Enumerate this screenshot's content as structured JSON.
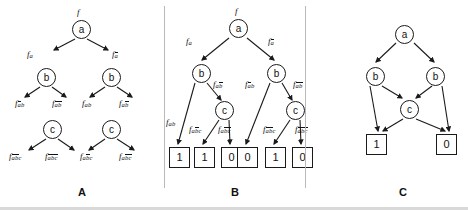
{
  "figure": {
    "caption_a": "A",
    "caption_b": "B",
    "caption_c": "C",
    "root_label": "f",
    "accent": "#1a1a1a",
    "divider_color": "#b9b9b9"
  },
  "panel_a": {
    "name": "shannon-expansion-levels",
    "level1": {
      "node": "a",
      "top_label": "f",
      "left_label": {
        "f": "f",
        "sub": "a",
        "bars": "none"
      },
      "right_label": {
        "f": "f",
        "sub": "a",
        "bars": "a"
      }
    },
    "level2": [
      {
        "node": "b",
        "left_label": {
          "f": "f",
          "sub": "ab",
          "bars": "a"
        },
        "right_label": {
          "f": "f",
          "sub": "ab",
          "bars": "ab"
        }
      },
      {
        "node": "b",
        "left_label": {
          "f": "f",
          "sub": "ab",
          "bars": "none"
        },
        "right_label": {
          "f": "f",
          "sub": "ab",
          "bars": "b"
        }
      }
    ],
    "level3": [
      {
        "node": "c",
        "left_label": {
          "f": "f",
          "sub": "abc",
          "bars": "ab"
        },
        "right_label": {
          "f": "f",
          "sub": "abc",
          "bars": "abc"
        }
      },
      {
        "node": "c",
        "left_label": {
          "f": "f",
          "sub": "abc",
          "bars": "b"
        },
        "right_label": {
          "f": "f",
          "sub": "abc",
          "bars": "bc"
        }
      }
    ]
  },
  "panel_b": {
    "name": "binary-decision-tree",
    "root": {
      "node": "a",
      "top_label": "f"
    },
    "edge_labels_level1": [
      {
        "f": "f",
        "sub": "a",
        "bars": "none"
      },
      {
        "f": "f",
        "sub": "a",
        "bars": "a"
      }
    ],
    "level2_nodes": [
      "b",
      "b"
    ],
    "edge_labels_level2": [
      {
        "f": "f",
        "sub": "ab",
        "bars": "none"
      },
      {
        "f": "f",
        "sub": "ab",
        "bars": "b"
      },
      {
        "f": "f",
        "sub": "ab",
        "bars": "a"
      },
      {
        "f": "f",
        "sub": "ab",
        "bars": "ab"
      }
    ],
    "level3_nodes": [
      "c",
      "c"
    ],
    "edge_labels_level3": [
      {
        "f": "f",
        "sub": "abc",
        "bars": "b"
      },
      {
        "f": "f",
        "sub": "abc",
        "bars": "bc"
      },
      {
        "f": "f",
        "sub": "abc",
        "bars": "ab"
      },
      {
        "f": "f",
        "sub": "abc",
        "bars": "abc"
      }
    ],
    "leaves": [
      "1",
      "1",
      "0",
      "0",
      "1",
      "0"
    ]
  },
  "panel_c": {
    "name": "reduced-ordered-bdd",
    "root": "a",
    "level2_nodes": [
      "b",
      "b"
    ],
    "shared_node": "c",
    "leaves": [
      "1",
      "0"
    ]
  }
}
